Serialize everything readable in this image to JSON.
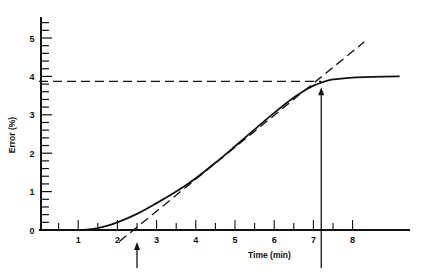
{
  "chart_data": {
    "type": "line",
    "title": "",
    "xlabel": "Time (min)",
    "ylabel": "Error (%)",
    "xlim": [
      0,
      9.2
    ],
    "ylim": [
      0,
      5.5
    ],
    "x_ticks": [
      1,
      2,
      3,
      4,
      5,
      6,
      7,
      8
    ],
    "y_ticks": [
      0,
      1,
      2,
      3,
      4,
      5
    ],
    "x_minor_step": 0.5,
    "y_minor_step": 0.2,
    "grid": false,
    "legend": null,
    "series": [
      {
        "name": "Error curve",
        "style": "solid",
        "x": [
          0,
          1.0,
          1.5,
          2.0,
          2.5,
          3.0,
          3.5,
          4.0,
          4.5,
          5.0,
          5.5,
          6.0,
          6.5,
          6.8,
          7.0,
          7.2,
          7.5,
          8.0,
          8.5,
          9.2
        ],
        "y": [
          0,
          0,
          0.05,
          0.2,
          0.42,
          0.7,
          1.0,
          1.35,
          1.75,
          2.18,
          2.62,
          3.05,
          3.45,
          3.65,
          3.76,
          3.84,
          3.92,
          3.97,
          3.99,
          4.0
        ]
      },
      {
        "name": "Tangent line",
        "style": "dashed",
        "x": [
          2.05,
          8.3
        ],
        "y": [
          -0.3,
          4.9
        ]
      },
      {
        "name": "Plateau level",
        "style": "dashed",
        "x": [
          0,
          7.2
        ],
        "y": [
          3.87,
          3.87
        ]
      }
    ],
    "annotations": [
      {
        "type": "arrow",
        "direction": "up",
        "x": 2.5,
        "label": "tangent intercept with time axis"
      },
      {
        "type": "arrow",
        "direction": "up",
        "x": 7.2,
        "label": "tangent intercept with plateau"
      }
    ]
  },
  "axes": {
    "x_label": "Time (min)",
    "y_label": "Error (%)",
    "x_tick_labels": [
      "1",
      "2",
      "3",
      "4",
      "5",
      "6",
      "7",
      "8"
    ],
    "y_tick_labels": [
      "0",
      "1",
      "2",
      "3",
      "4",
      "5"
    ]
  }
}
